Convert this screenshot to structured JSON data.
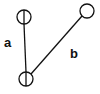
{
  "diagram": {
    "colors": {
      "stroke": "#111111",
      "background": "#ffffff"
    },
    "nodes": [
      {
        "id": "node-top-left",
        "cx": 24,
        "cy": 17,
        "r": 7,
        "inner_line": true
      },
      {
        "id": "node-bottom",
        "cx": 26,
        "cy": 79,
        "r": 7,
        "inner_line": true
      },
      {
        "id": "node-top-right",
        "cx": 87,
        "cy": 11,
        "r": 7,
        "inner_line": false
      }
    ],
    "edges": [
      {
        "id": "edge-a",
        "label": "a",
        "from": "node-top-left",
        "to": "node-bottom"
      },
      {
        "id": "edge-b",
        "label": "b",
        "from": "node-bottom",
        "to": "node-top-right"
      }
    ],
    "labels": {
      "a": "a",
      "b": "b"
    }
  }
}
